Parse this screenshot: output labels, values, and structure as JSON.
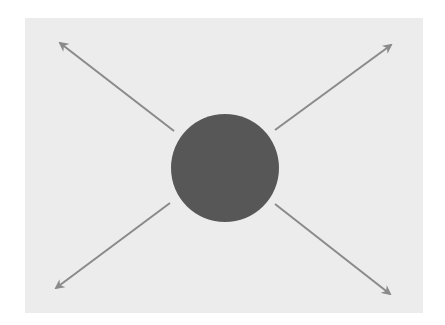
{
  "diagram": {
    "colors": {
      "background": "#ffffff",
      "panel": "#ececec",
      "circle": "#575757",
      "arrow": "#8a8a8a"
    },
    "circle": {
      "cx": 225,
      "cy": 168,
      "r": 54
    },
    "arrows": [
      {
        "name": "arrow-up-left",
        "x1": 174,
        "y1": 131,
        "x2": 60,
        "y2": 43
      },
      {
        "name": "arrow-up-right",
        "x1": 275,
        "y1": 130,
        "x2": 391,
        "y2": 45
      },
      {
        "name": "arrow-down-left",
        "x1": 170,
        "y1": 203,
        "x2": 56,
        "y2": 288
      },
      {
        "name": "arrow-down-right",
        "x1": 275,
        "y1": 204,
        "x2": 390,
        "y2": 294
      }
    ]
  }
}
